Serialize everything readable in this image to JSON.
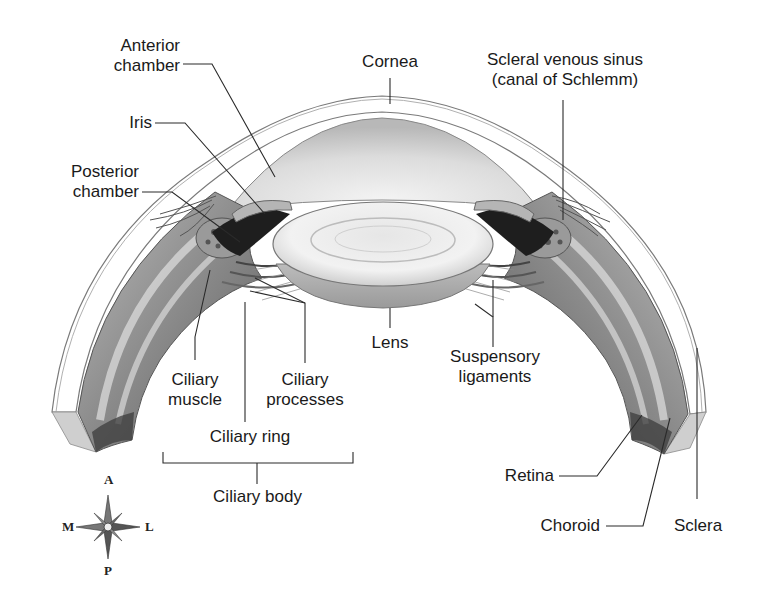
{
  "diagram": {
    "labels": {
      "anterior_chamber_1": "Anterior",
      "anterior_chamber_2": "chamber",
      "iris": "Iris",
      "posterior_chamber_1": "Posterior",
      "posterior_chamber_2": "chamber",
      "cornea": "Cornea",
      "scleral_sinus_1": "Scleral venous sinus",
      "scleral_sinus_2": "(canal of Schlemm)",
      "lens": "Lens",
      "suspensory_1": "Suspensory",
      "suspensory_2": "ligaments",
      "ciliary_muscle_1": "Ciliary",
      "ciliary_muscle_2": "muscle",
      "ciliary_processes_1": "Ciliary",
      "ciliary_processes_2": "processes",
      "ciliary_ring": "Ciliary ring",
      "ciliary_body": "Ciliary body",
      "retina": "Retina",
      "choroid": "Choroid",
      "sclera": "Sclera"
    },
    "compass": {
      "top": "A",
      "bottom": "P",
      "left": "M",
      "right": "L"
    },
    "colors": {
      "leader_line": "#2a2a2a",
      "text": "#1a1a1a",
      "tissue_dark": "#2b2b2b",
      "tissue_mid": "#8c8c8c",
      "tissue_light": "#d4d4d4"
    }
  }
}
